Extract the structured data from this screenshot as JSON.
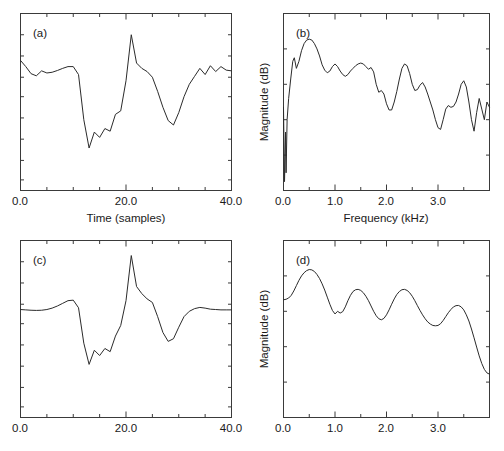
{
  "figure": {
    "title": "",
    "background": "#ffffff",
    "line_color": "#2b2b2b",
    "axis_color": "#3a3a3a"
  },
  "chart_data": [
    {
      "type": "line",
      "panel": "(a)",
      "title": "",
      "xlabel": "Time (samples)",
      "ylabel": "",
      "xlim": [
        0,
        40
      ],
      "ylim": [
        0,
        1
      ],
      "xticks": [
        0,
        20,
        40
      ],
      "xticklabels": [
        "0.0",
        "20.0",
        "40.0"
      ],
      "yticks": [],
      "yticklabels": [],
      "minor_xticks": [
        5,
        10,
        15,
        25,
        30,
        35
      ],
      "minor_yticks": [
        0.06,
        0.17,
        0.29,
        0.41,
        0.53,
        0.64,
        0.76,
        0.88
      ],
      "grid": false,
      "legend": null,
      "x": [
        0,
        1,
        2,
        3,
        4,
        5,
        6,
        7,
        8,
        9,
        10,
        11,
        12,
        13,
        14,
        15,
        16,
        17,
        18,
        19,
        20,
        21,
        22,
        23,
        24,
        25,
        26,
        27,
        28,
        29,
        30,
        31,
        32,
        33,
        34,
        35,
        36,
        37,
        38,
        39,
        40
      ],
      "values": [
        0.735,
        0.7,
        0.66,
        0.648,
        0.676,
        0.664,
        0.668,
        0.678,
        0.69,
        0.7,
        0.7,
        0.655,
        0.4,
        0.24,
        0.33,
        0.3,
        0.35,
        0.335,
        0.43,
        0.45,
        0.62,
        0.88,
        0.72,
        0.69,
        0.672,
        0.64,
        0.56,
        0.47,
        0.395,
        0.37,
        0.44,
        0.53,
        0.6,
        0.645,
        0.69,
        0.655,
        0.705,
        0.672,
        0.7,
        0.68,
        0.676
      ]
    },
    {
      "type": "line",
      "panel": "(b)",
      "title": "",
      "xlabel": "Frequency (kHz)",
      "ylabel": "Magnitude (dB)",
      "xlim": [
        0,
        4
      ],
      "ylim": [
        0,
        1
      ],
      "xticks": [
        0,
        1,
        2,
        3
      ],
      "xticklabels": [
        "0.0",
        "1.0",
        "2.0",
        "3.0"
      ],
      "yticks": [],
      "yticklabels": [],
      "minor_xticks": [
        0.5,
        1.5,
        2.5,
        3.5
      ],
      "minor_yticks": [
        0.2,
        0.4,
        0.6,
        0.8
      ],
      "grid": false,
      "legend": null,
      "x": [
        0.0,
        0.02,
        0.04,
        0.05,
        0.07,
        0.1,
        0.14,
        0.18,
        0.21,
        0.25,
        0.3,
        0.35,
        0.4,
        0.45,
        0.5,
        0.55,
        0.6,
        0.65,
        0.7,
        0.75,
        0.8,
        0.85,
        0.9,
        0.95,
        1.0,
        1.05,
        1.1,
        1.15,
        1.2,
        1.25,
        1.3,
        1.35,
        1.4,
        1.45,
        1.5,
        1.55,
        1.6,
        1.65,
        1.7,
        1.75,
        1.8,
        1.85,
        1.9,
        1.95,
        2.0,
        2.05,
        2.1,
        2.15,
        2.2,
        2.25,
        2.3,
        2.35,
        2.4,
        2.45,
        2.5,
        2.55,
        2.6,
        2.65,
        2.7,
        2.75,
        2.8,
        2.85,
        2.9,
        2.95,
        3.0,
        3.05,
        3.1,
        3.15,
        3.2,
        3.25,
        3.3,
        3.35,
        3.4,
        3.45,
        3.5,
        3.55,
        3.6,
        3.65,
        3.7,
        3.75,
        3.8,
        3.85,
        3.9,
        3.95,
        4.0
      ],
      "values": [
        0.47,
        0.05,
        0.33,
        0.1,
        0.4,
        0.52,
        0.63,
        0.73,
        0.75,
        0.69,
        0.73,
        0.79,
        0.83,
        0.85,
        0.855,
        0.85,
        0.83,
        0.8,
        0.76,
        0.71,
        0.68,
        0.665,
        0.675,
        0.7,
        0.715,
        0.7,
        0.675,
        0.655,
        0.645,
        0.655,
        0.675,
        0.69,
        0.705,
        0.715,
        0.72,
        0.715,
        0.7,
        0.685,
        0.695,
        0.67,
        0.6,
        0.555,
        0.565,
        0.545,
        0.49,
        0.455,
        0.455,
        0.5,
        0.56,
        0.63,
        0.69,
        0.715,
        0.705,
        0.66,
        0.6,
        0.565,
        0.57,
        0.595,
        0.61,
        0.585,
        0.545,
        0.5,
        0.455,
        0.4,
        0.355,
        0.345,
        0.4,
        0.46,
        0.48,
        0.47,
        0.475,
        0.5,
        0.545,
        0.6,
        0.62,
        0.585,
        0.5,
        0.4,
        0.335,
        0.44,
        0.52,
        0.46,
        0.4,
        0.5,
        0.47
      ]
    },
    {
      "type": "line",
      "panel": "(c)",
      "title": "",
      "xlabel": "",
      "ylabel": "",
      "xlim": [
        0,
        40
      ],
      "ylim": [
        0,
        1
      ],
      "xticks": [
        0,
        20,
        40
      ],
      "xticklabels": [
        "0.0",
        "20.0",
        "40.0"
      ],
      "yticks": [],
      "yticklabels": [],
      "minor_xticks": [
        5,
        10,
        15,
        25,
        30,
        35
      ],
      "minor_yticks": [
        0.06,
        0.17,
        0.29,
        0.41,
        0.53,
        0.64,
        0.76,
        0.88
      ],
      "grid": false,
      "legend": null,
      "x": [
        0,
        1,
        2,
        3,
        4,
        5,
        6,
        7,
        8,
        9,
        10,
        11,
        12,
        13,
        14,
        15,
        16,
        17,
        18,
        19,
        20,
        21,
        22,
        23,
        24,
        25,
        26,
        27,
        28,
        29,
        30,
        31,
        32,
        33,
        34,
        35,
        36,
        37,
        38,
        39,
        40
      ],
      "values": [
        0.61,
        0.608,
        0.606,
        0.605,
        0.606,
        0.61,
        0.618,
        0.63,
        0.645,
        0.66,
        0.663,
        0.62,
        0.42,
        0.3,
        0.38,
        0.35,
        0.39,
        0.372,
        0.46,
        0.52,
        0.66,
        0.915,
        0.74,
        0.7,
        0.67,
        0.65,
        0.57,
        0.48,
        0.43,
        0.445,
        0.51,
        0.57,
        0.6,
        0.615,
        0.622,
        0.618,
        0.612,
        0.61,
        0.608,
        0.608,
        0.608
      ]
    },
    {
      "type": "line",
      "panel": "(d)",
      "title": "",
      "xlabel": "",
      "ylabel": "Magnitude (dB)",
      "xlim": [
        0,
        4
      ],
      "ylim": [
        0,
        1
      ],
      "xticks": [
        0,
        1,
        2,
        3
      ],
      "xticklabels": [
        "0.0",
        "1.0",
        "2.0",
        "3.0"
      ],
      "yticks": [],
      "yticklabels": [],
      "minor_xticks": [
        0.5,
        1.5,
        2.5,
        3.5
      ],
      "minor_yticks": [
        0.2,
        0.4,
        0.6,
        0.8
      ],
      "grid": false,
      "legend": null,
      "x": [
        0.0,
        0.05,
        0.1,
        0.15,
        0.2,
        0.25,
        0.3,
        0.35,
        0.4,
        0.45,
        0.5,
        0.55,
        0.6,
        0.65,
        0.7,
        0.75,
        0.8,
        0.85,
        0.9,
        0.95,
        1.0,
        1.05,
        1.1,
        1.15,
        1.2,
        1.25,
        1.3,
        1.35,
        1.4,
        1.45,
        1.5,
        1.55,
        1.6,
        1.65,
        1.7,
        1.75,
        1.8,
        1.85,
        1.9,
        1.95,
        2.0,
        2.05,
        2.1,
        2.15,
        2.2,
        2.25,
        2.3,
        2.35,
        2.4,
        2.45,
        2.5,
        2.55,
        2.6,
        2.65,
        2.7,
        2.75,
        2.8,
        2.85,
        2.9,
        2.95,
        3.0,
        3.05,
        3.1,
        3.15,
        3.2,
        3.25,
        3.3,
        3.35,
        3.4,
        3.45,
        3.5,
        3.55,
        3.6,
        3.65,
        3.7,
        3.75,
        3.8,
        3.85,
        3.9,
        3.95,
        4.0
      ],
      "values": [
        0.665,
        0.668,
        0.675,
        0.69,
        0.715,
        0.745,
        0.775,
        0.8,
        0.818,
        0.83,
        0.836,
        0.834,
        0.825,
        0.808,
        0.785,
        0.755,
        0.72,
        0.68,
        0.64,
        0.605,
        0.585,
        0.6,
        0.59,
        0.598,
        0.625,
        0.66,
        0.69,
        0.712,
        0.722,
        0.724,
        0.718,
        0.705,
        0.685,
        0.66,
        0.63,
        0.6,
        0.575,
        0.558,
        0.552,
        0.56,
        0.58,
        0.608,
        0.64,
        0.67,
        0.695,
        0.712,
        0.722,
        0.724,
        0.718,
        0.705,
        0.685,
        0.66,
        0.632,
        0.605,
        0.58,
        0.558,
        0.54,
        0.528,
        0.52,
        0.518,
        0.52,
        0.53,
        0.548,
        0.57,
        0.592,
        0.61,
        0.625,
        0.632,
        0.633,
        0.625,
        0.608,
        0.58,
        0.545,
        0.5,
        0.45,
        0.398,
        0.348,
        0.305,
        0.272,
        0.252,
        0.245
      ]
    }
  ]
}
